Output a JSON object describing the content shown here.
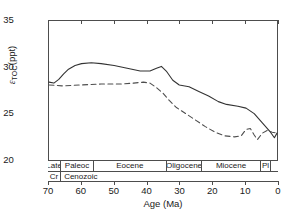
{
  "chart_data": {
    "type": "line",
    "title": "",
    "xlabel": "Age (Ma)",
    "ylabel": "εTOC (ppt)",
    "ylabel_symbol": "ε",
    "ylabel_sub": "TOC",
    "ylabel_unit": "(ppt)",
    "xlim": [
      70,
      0
    ],
    "ylim": [
      20,
      35
    ],
    "x_reversed": true,
    "grid": false,
    "legend": "none",
    "xticks": [
      70,
      60,
      50,
      40,
      30,
      20,
      10,
      0
    ],
    "yticks": [
      20,
      25,
      30,
      35
    ],
    "series": [
      {
        "name": "solid",
        "style": "solid",
        "color": "#333333",
        "points": [
          [
            70.0,
            28.4
          ],
          [
            68.5,
            28.3
          ],
          [
            67.0,
            28.7
          ],
          [
            65.5,
            29.3
          ],
          [
            64.0,
            29.8
          ],
          [
            62.0,
            30.2
          ],
          [
            60.0,
            30.4
          ],
          [
            57.0,
            30.5
          ],
          [
            54.0,
            30.4
          ],
          [
            50.0,
            30.2
          ],
          [
            46.0,
            29.9
          ],
          [
            42.0,
            29.6
          ],
          [
            39.0,
            29.6
          ],
          [
            37.0,
            29.9
          ],
          [
            35.5,
            30.1
          ],
          [
            34.0,
            29.6
          ],
          [
            32.0,
            28.6
          ],
          [
            30.0,
            28.1
          ],
          [
            27.0,
            27.9
          ],
          [
            24.0,
            27.4
          ],
          [
            21.0,
            26.9
          ],
          [
            18.0,
            26.3
          ],
          [
            15.5,
            26.0
          ],
          [
            12.0,
            25.8
          ],
          [
            9.5,
            25.6
          ],
          [
            7.0,
            25.0
          ],
          [
            4.5,
            24.0
          ],
          [
            2.0,
            23.0
          ],
          [
            0.8,
            22.4
          ],
          [
            0.0,
            22.9
          ]
        ]
      },
      {
        "name": "dashed",
        "style": "dashed",
        "color": "#4d4d4d",
        "points": [
          [
            70.0,
            28.1
          ],
          [
            66.0,
            28.0
          ],
          [
            60.0,
            28.1
          ],
          [
            54.0,
            28.2
          ],
          [
            48.0,
            28.2
          ],
          [
            44.0,
            28.3
          ],
          [
            41.0,
            28.4
          ],
          [
            39.0,
            28.3
          ],
          [
            37.0,
            27.8
          ],
          [
            35.0,
            27.2
          ],
          [
            33.0,
            26.4
          ],
          [
            31.0,
            25.7
          ],
          [
            28.0,
            25.0
          ],
          [
            25.0,
            24.3
          ],
          [
            22.0,
            23.6
          ],
          [
            19.0,
            23.0
          ],
          [
            16.0,
            22.6
          ],
          [
            13.0,
            22.5
          ],
          [
            11.0,
            22.6
          ],
          [
            9.5,
            23.3
          ],
          [
            8.2,
            23.4
          ],
          [
            7.0,
            22.7
          ],
          [
            6.0,
            22.2
          ],
          [
            4.5,
            22.9
          ],
          [
            3.0,
            23.2
          ],
          [
            1.5,
            23.0
          ],
          [
            0.0,
            22.9
          ]
        ]
      }
    ]
  },
  "timescale": {
    "epochs": [
      {
        "label": "Late",
        "start": 70,
        "end": 66.0
      },
      {
        "label": "Paleoc",
        "start": 66.0,
        "end": 56.0
      },
      {
        "label": "Eocene",
        "start": 56.0,
        "end": 33.9
      },
      {
        "label": "Oligocene",
        "start": 33.9,
        "end": 23.0
      },
      {
        "label": "Miocene",
        "start": 23.0,
        "end": 5.3
      },
      {
        "label": "Pl",
        "start": 5.3,
        "end": 2.0
      },
      {
        "label": "",
        "start": 2.0,
        "end": 0
      }
    ],
    "eras": [
      {
        "label": "Cr",
        "start": 70,
        "end": 66.0
      },
      {
        "label": "Cenozoic",
        "start": 66.0,
        "end": 0
      }
    ]
  }
}
